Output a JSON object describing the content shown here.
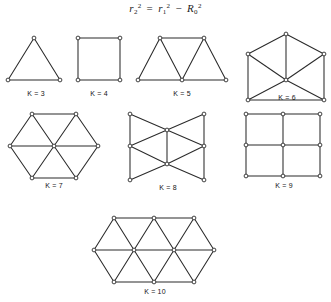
{
  "figure": {
    "equation": {
      "lhs_base": "r",
      "lhs_sub": "2",
      "lhs_sup": "2",
      "equals": "=",
      "rhs1_base": "r",
      "rhs1_sub": "1",
      "rhs1_sup": "2",
      "minus": "−",
      "rhs2_base": "R",
      "rhs2_sub": "0",
      "rhs2_sup": "2",
      "plain": "r2^2 = r1^2 - R0^2"
    },
    "colors": {
      "background": "#ffffff",
      "edge": "#2b2b2b",
      "node_fill": "#ffffff",
      "node_stroke": "#2b2b2b",
      "text": "#141414"
    },
    "graphs": [
      {
        "id": "k3",
        "label": "K = 3",
        "k": 3,
        "shape": "triangle",
        "box": {
          "x": 4,
          "y": 34,
          "w": 64,
          "h": 56
        },
        "label_top": 56,
        "vertices": [
          {
            "x": 30,
            "y": 4
          },
          {
            "x": 4,
            "y": 46
          },
          {
            "x": 56,
            "y": 46
          }
        ],
        "edges": [
          [
            0,
            1
          ],
          [
            1,
            2
          ],
          [
            2,
            0
          ]
        ]
      },
      {
        "id": "k4",
        "label": "K = 4",
        "k": 4,
        "shape": "square",
        "box": {
          "x": 70,
          "y": 34,
          "w": 58,
          "h": 56
        },
        "label_top": 56,
        "vertices": [
          {
            "x": 8,
            "y": 4
          },
          {
            "x": 50,
            "y": 4
          },
          {
            "x": 50,
            "y": 46
          },
          {
            "x": 8,
            "y": 46
          }
        ],
        "edges": [
          [
            0,
            1
          ],
          [
            1,
            2
          ],
          [
            2,
            3
          ],
          [
            3,
            0
          ]
        ]
      },
      {
        "id": "k5",
        "label": "K = 5",
        "k": 5,
        "shape": "triangle-strip-trapezoid",
        "box": {
          "x": 136,
          "y": 34,
          "w": 92,
          "h": 56
        },
        "label_top": 56,
        "vertices": [
          {
            "x": 24,
            "y": 4
          },
          {
            "x": 68,
            "y": 4
          },
          {
            "x": 2,
            "y": 46
          },
          {
            "x": 46,
            "y": 46
          },
          {
            "x": 90,
            "y": 46
          }
        ],
        "edges": [
          [
            0,
            1
          ],
          [
            2,
            3
          ],
          [
            3,
            4
          ],
          [
            0,
            2
          ],
          [
            0,
            3
          ],
          [
            1,
            3
          ],
          [
            1,
            4
          ]
        ]
      },
      {
        "id": "k6",
        "label": "K = 6",
        "k": 6,
        "shape": "bowtie-vertical",
        "box": {
          "x": 244,
          "y": 32,
          "w": 86,
          "h": 72
        },
        "label_top": 62,
        "vertices": [
          {
            "x": 42,
            "y": 2
          },
          {
            "x": 4,
            "y": 22
          },
          {
            "x": 80,
            "y": 22
          },
          {
            "x": 42,
            "y": 48
          },
          {
            "x": 4,
            "y": 68
          },
          {
            "x": 80,
            "y": 68
          }
        ],
        "edges": [
          [
            0,
            1
          ],
          [
            0,
            2
          ],
          [
            0,
            3
          ],
          [
            1,
            3
          ],
          [
            2,
            3
          ],
          [
            1,
            4
          ],
          [
            2,
            5
          ],
          [
            3,
            4
          ],
          [
            3,
            5
          ],
          [
            4,
            5
          ]
        ]
      },
      {
        "id": "k7",
        "label": "K = 7",
        "k": 7,
        "shape": "hexagon-with-center",
        "box": {
          "x": 8,
          "y": 112,
          "w": 92,
          "h": 80
        },
        "label_top": 70,
        "vertices": [
          {
            "x": 24,
            "y": 2
          },
          {
            "x": 68,
            "y": 2
          },
          {
            "x": 90,
            "y": 34
          },
          {
            "x": 68,
            "y": 66
          },
          {
            "x": 24,
            "y": 66
          },
          {
            "x": 2,
            "y": 34
          },
          {
            "x": 46,
            "y": 34
          }
        ],
        "edges": [
          [
            0,
            1
          ],
          [
            1,
            2
          ],
          [
            2,
            3
          ],
          [
            3,
            4
          ],
          [
            4,
            5
          ],
          [
            5,
            0
          ],
          [
            6,
            0
          ],
          [
            6,
            1
          ],
          [
            6,
            2
          ],
          [
            6,
            3
          ],
          [
            6,
            4
          ],
          [
            6,
            5
          ]
        ]
      },
      {
        "id": "k8",
        "label": "K = 8",
        "k": 8,
        "shape": "double-bowtie",
        "box": {
          "x": 128,
          "y": 112,
          "w": 80,
          "h": 82
        },
        "label_top": 72,
        "vertices": [
          {
            "x": 2,
            "y": 2
          },
          {
            "x": 76,
            "y": 2
          },
          {
            "x": 2,
            "y": 34
          },
          {
            "x": 76,
            "y": 34
          },
          {
            "x": 2,
            "y": 68
          },
          {
            "x": 76,
            "y": 68
          },
          {
            "x": 39,
            "y": 18
          },
          {
            "x": 39,
            "y": 52
          }
        ],
        "edges": [
          [
            0,
            2
          ],
          [
            2,
            4
          ],
          [
            1,
            3
          ],
          [
            3,
            5
          ],
          [
            0,
            6
          ],
          [
            1,
            6
          ],
          [
            2,
            6
          ],
          [
            3,
            6
          ],
          [
            4,
            7
          ],
          [
            5,
            7
          ],
          [
            2,
            7
          ],
          [
            3,
            7
          ],
          [
            6,
            7
          ]
        ]
      },
      {
        "id": "k9",
        "label": "K = 9",
        "k": 9,
        "shape": "grid-3x3",
        "box": {
          "x": 244,
          "y": 112,
          "w": 80,
          "h": 80
        },
        "label_top": 70,
        "vertices": [
          {
            "x": 2,
            "y": 2
          },
          {
            "x": 39,
            "y": 2
          },
          {
            "x": 76,
            "y": 2
          },
          {
            "x": 2,
            "y": 33
          },
          {
            "x": 39,
            "y": 33
          },
          {
            "x": 76,
            "y": 33
          },
          {
            "x": 2,
            "y": 64
          },
          {
            "x": 39,
            "y": 64
          },
          {
            "x": 76,
            "y": 64
          }
        ],
        "edges": [
          [
            0,
            1
          ],
          [
            1,
            2
          ],
          [
            3,
            4
          ],
          [
            4,
            5
          ],
          [
            6,
            7
          ],
          [
            7,
            8
          ],
          [
            0,
            3
          ],
          [
            3,
            6
          ],
          [
            1,
            4
          ],
          [
            4,
            7
          ],
          [
            2,
            5
          ],
          [
            5,
            8
          ]
        ]
      },
      {
        "id": "k10",
        "label": "K = 10",
        "k": 10,
        "shape": "elongated-hexagon-lattice",
        "box": {
          "x": 92,
          "y": 216,
          "w": 126,
          "h": 84
        },
        "label_top": 72,
        "vertices": [
          {
            "x": 22,
            "y": 2
          },
          {
            "x": 62,
            "y": 2
          },
          {
            "x": 102,
            "y": 2
          },
          {
            "x": 2,
            "y": 34
          },
          {
            "x": 42,
            "y": 34
          },
          {
            "x": 82,
            "y": 34
          },
          {
            "x": 122,
            "y": 34
          },
          {
            "x": 22,
            "y": 66
          },
          {
            "x": 62,
            "y": 66
          },
          {
            "x": 102,
            "y": 66
          }
        ],
        "edges": [
          [
            0,
            1
          ],
          [
            1,
            2
          ],
          [
            3,
            4
          ],
          [
            4,
            5
          ],
          [
            5,
            6
          ],
          [
            7,
            8
          ],
          [
            8,
            9
          ],
          [
            3,
            0
          ],
          [
            0,
            4
          ],
          [
            4,
            1
          ],
          [
            1,
            5
          ],
          [
            5,
            2
          ],
          [
            2,
            6
          ],
          [
            3,
            7
          ],
          [
            7,
            4
          ],
          [
            4,
            8
          ],
          [
            8,
            5
          ],
          [
            5,
            9
          ],
          [
            9,
            6
          ]
        ]
      }
    ]
  }
}
